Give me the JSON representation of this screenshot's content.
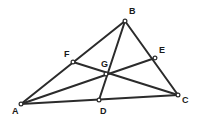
{
  "figure": {
    "background_color": "#ffffff",
    "line_color": "#2b2b2b",
    "vertex_fill_color": "#ffffff",
    "label_color": "#1a1a1a",
    "width": 199,
    "height": 123
  },
  "points": {
    "A": {
      "label": "A",
      "x": 21,
      "y": 104,
      "label_x": 12,
      "label_y": 107
    },
    "B": {
      "label": "B",
      "x": 125,
      "y": 21,
      "label_x": 129,
      "label_y": 7
    },
    "C": {
      "label": "C",
      "x": 178,
      "y": 95,
      "label_x": 182,
      "label_y": 96
    },
    "D": {
      "label": "D",
      "x": 99,
      "y": 100,
      "label_x": 100,
      "label_y": 107
    },
    "E": {
      "label": "E",
      "x": 155,
      "y": 58,
      "label_x": 159,
      "label_y": 46
    },
    "F": {
      "label": "F",
      "x": 73,
      "y": 62,
      "label_x": 64,
      "label_y": 50
    },
    "G": {
      "label": "G",
      "x": 106,
      "y": 74,
      "label_x": 101,
      "label_y": 60
    }
  },
  "edges": [
    {
      "name": "side-AB",
      "from": "A",
      "to": "B"
    },
    {
      "name": "side-BC",
      "from": "B",
      "to": "C"
    },
    {
      "name": "side-CA",
      "from": "C",
      "to": "A"
    }
  ],
  "cevians": [
    {
      "name": "median-AE",
      "from": "A",
      "to": "E"
    },
    {
      "name": "median-BD",
      "from": "B",
      "to": "D"
    },
    {
      "name": "median-CF",
      "from": "C",
      "to": "F"
    }
  ],
  "vertex_order": [
    "A",
    "B",
    "C",
    "D",
    "E",
    "F",
    "G"
  ]
}
